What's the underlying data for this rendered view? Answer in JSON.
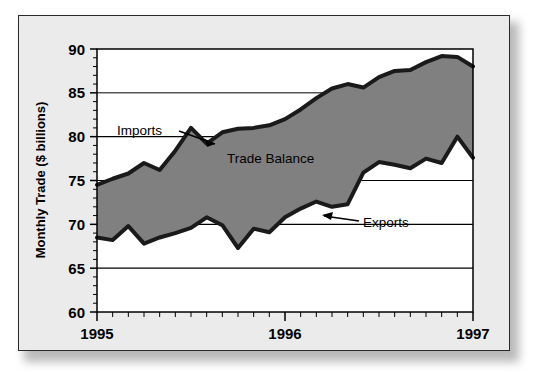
{
  "figure": {
    "panel_background": "#ebebeb",
    "plot_background": "#ffffff",
    "frame_color": "#000000"
  },
  "chart_data": {
    "type": "area",
    "title": "",
    "subtitle": "",
    "xlabel": "",
    "ylabel": "Monthly Trade ($ billions)",
    "ylim": [
      60,
      90
    ],
    "xlim": [
      0,
      24
    ],
    "ytick_labels": [
      "60",
      "65",
      "70",
      "75",
      "80",
      "85",
      "90"
    ],
    "ytick_values": [
      60,
      65,
      70,
      75,
      80,
      85,
      90
    ],
    "xtick_labels": [
      "1995",
      "1996",
      "1997"
    ],
    "xtick_values": [
      0,
      12,
      24
    ],
    "x_minor_ticks": 25,
    "grid": "horizontal",
    "legend_position": "inline-annotations",
    "fill_color": "#808080",
    "line_color": "#1a1a1a",
    "line_width": 4,
    "x": [
      0,
      1,
      2,
      3,
      4,
      5,
      6,
      7,
      8,
      9,
      10,
      11,
      12,
      13,
      14,
      15,
      16,
      17,
      18,
      19,
      20,
      21,
      22,
      23,
      24
    ],
    "series": [
      {
        "name": "Imports",
        "values": [
          74.5,
          75.2,
          75.8,
          77.0,
          76.2,
          78.4,
          81.0,
          79.2,
          80.5,
          80.9,
          81.0,
          81.3,
          82.0,
          83.1,
          84.4,
          85.5,
          86.0,
          85.6,
          86.8,
          87.5,
          87.6,
          88.5,
          89.2,
          89.1,
          88.0
        ]
      },
      {
        "name": "Exports",
        "values": [
          68.5,
          68.2,
          69.8,
          67.8,
          68.5,
          69.0,
          69.6,
          70.8,
          69.9,
          67.3,
          69.5,
          69.1,
          70.8,
          71.8,
          72.6,
          72.0,
          72.3,
          75.9,
          77.1,
          76.8,
          76.4,
          77.5,
          77.0,
          80.0,
          77.6
        ]
      }
    ],
    "annotations": [
      {
        "text": "Imports",
        "kind": "series-callout",
        "target": "Imports"
      },
      {
        "text": "Exports",
        "kind": "series-callout",
        "target": "Exports"
      },
      {
        "text": "Trade Balance",
        "kind": "area-label",
        "target": "fill-region"
      }
    ]
  }
}
